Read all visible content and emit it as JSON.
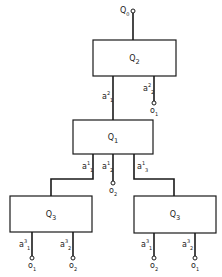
{
  "root": {
    "label": "Q",
    "sub": "0"
  },
  "boxes": [
    {
      "id": "q2",
      "label": "Q",
      "sub": "2"
    },
    {
      "id": "q1",
      "label": "Q",
      "sub": "1"
    },
    {
      "id": "q3_left",
      "label": "Q",
      "sub": "3"
    },
    {
      "id": "q3_right",
      "label": "Q",
      "sub": "3"
    }
  ],
  "edges": {
    "q2_a1": {
      "base": "a",
      "sup": "2",
      "sub": "1"
    },
    "q2_a2": {
      "base": "a",
      "sup": "2",
      "sub": "2"
    },
    "q1_a1": {
      "base": "a",
      "sup": "1",
      "sub": "1"
    },
    "q1_a2": {
      "base": "a",
      "sup": "1",
      "sub": "2"
    },
    "q1_a3": {
      "base": "a",
      "sup": "1",
      "sub": "3"
    },
    "q3l_a1": {
      "base": "a",
      "sup": "3",
      "sub": "1"
    },
    "q3l_a2": {
      "base": "a",
      "sup": "3",
      "sub": "2"
    },
    "q3r_a1": {
      "base": "a",
      "sup": "3",
      "sub": "1"
    },
    "q3r_a2": {
      "base": "a",
      "sup": "3",
      "sub": "2"
    }
  },
  "terminals": {
    "q2_out": {
      "base": "o",
      "sub": "1"
    },
    "q1_out": {
      "base": "o",
      "sub": "2"
    },
    "q3l_out1": {
      "base": "o",
      "sub": "1"
    },
    "q3l_out2": {
      "base": "o",
      "sub": "2"
    },
    "q3r_out1": {
      "base": "o",
      "sub": "2"
    },
    "q3r_out2": {
      "base": "o",
      "sub": "1"
    }
  }
}
